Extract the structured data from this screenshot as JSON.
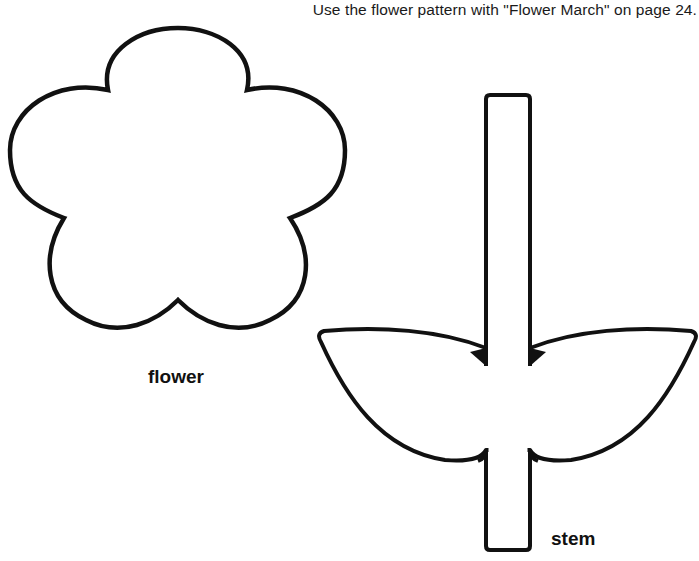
{
  "page": {
    "instruction": "Use the flower pattern with \"Flower March\" on page 24."
  },
  "patterns": [
    {
      "id": "flower",
      "label": "flower",
      "shape": "five-petal-flower-outline"
    },
    {
      "id": "stem",
      "label": "stem",
      "shape": "stem-with-two-leaves-outline"
    }
  ],
  "colors": {
    "outline": "#111111",
    "background": "#ffffff"
  }
}
